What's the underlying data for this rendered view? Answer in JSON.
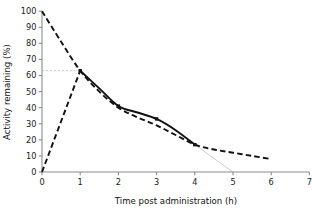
{
  "chart_data": {
    "type": "line",
    "title": "",
    "xlabel": "Time post administration (h)",
    "ylabel": "Activity remaining (%)",
    "xlim": [
      0,
      7
    ],
    "ylim": [
      0,
      100
    ],
    "xticks": [
      0,
      1,
      2,
      3,
      4,
      5,
      6,
      7
    ],
    "yticks": [
      0,
      10,
      20,
      30,
      40,
      50,
      60,
      70,
      80,
      90,
      100
    ],
    "xtick_labels": [
      "0",
      "1",
      "2",
      "3",
      "4",
      "5",
      "6",
      "7"
    ],
    "ytick_labels": [
      "0",
      "10",
      "20",
      "30",
      "40",
      "50",
      "60",
      "70",
      "80",
      "90",
      "100"
    ],
    "grid": false,
    "legend": "none",
    "series": [
      {
        "name": "observed-activity",
        "style": "solid",
        "color": "#111111",
        "markers": true,
        "x": [
          1,
          1.5,
          2,
          2.5,
          3,
          3.5,
          4
        ],
        "values": [
          63,
          52,
          41,
          37,
          33,
          26,
          17
        ]
      },
      {
        "name": "fitted-elimination",
        "style": "dashed",
        "color": "#111111",
        "markers": false,
        "x": [
          0,
          0.5,
          1,
          1.5,
          2,
          2.5,
          3,
          3.5,
          4,
          4.5,
          5,
          5.5,
          6
        ],
        "values": [
          100,
          81,
          63,
          50,
          40,
          34,
          29,
          23,
          17,
          14,
          12,
          10,
          8
        ]
      },
      {
        "name": "absorption-phase",
        "style": "dashed",
        "color": "#111111",
        "markers": false,
        "x": [
          0,
          1
        ],
        "values": [
          0,
          63
        ]
      }
    ],
    "reference_lines": [
      {
        "name": "peak-activity-guide",
        "orientation": "horizontal",
        "style": "dashed-grey",
        "color": "#c4c4c4",
        "y": 63,
        "x_from": 0,
        "x_to": 1
      },
      {
        "name": "terminal-extrapolation-guide",
        "orientation": "oblique",
        "style": "solid-grey",
        "color": "#c9c9c9",
        "x_from": 4,
        "y_from": 17,
        "x_to": 5,
        "y_to": 0
      }
    ],
    "annotations": [
      {
        "name": "peak-point",
        "x": 1,
        "y": 63
      },
      {
        "name": "mid-point",
        "x": 2,
        "y": 41
      },
      {
        "name": "late-point",
        "x": 3,
        "y": 33
      },
      {
        "name": "end-point",
        "x": 4,
        "y": 17
      }
    ]
  }
}
